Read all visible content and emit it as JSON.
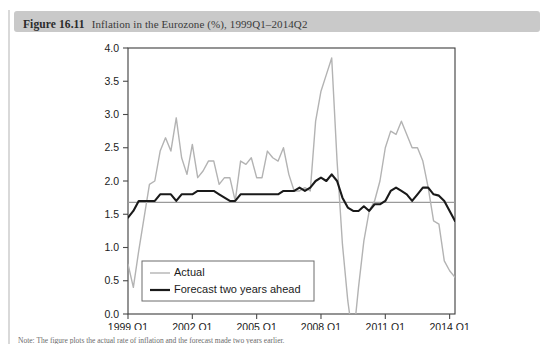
{
  "figure": {
    "number_label": "Figure 16.11",
    "caption": "Inflation in the Eurozone (%), 1999Q1–2014Q2",
    "source_note": "Note: The figure plots the actual rate of inflation and the forecast made two years earlier."
  },
  "colors": {
    "caption_bar": "#c9c9c9",
    "actual_line": "#b3b3b3",
    "forecast_line": "#1a1a1a",
    "reference_line": "#9a9a9a",
    "axis": "#4a4a4a",
    "plot_border": "#3c3c3c",
    "background": "#ffffff"
  },
  "chart_data": {
    "type": "line",
    "title": "Inflation in the Eurozone (%), 1999Q1–2014Q2",
    "xlabel": "",
    "ylabel": "",
    "ylim": [
      0.0,
      4.0
    ],
    "yticks": [
      0.0,
      0.5,
      1.0,
      1.5,
      2.0,
      2.5,
      3.0,
      3.5,
      4.0
    ],
    "ytick_labels": [
      "0.0",
      "0.5",
      "1.0",
      "1.5",
      "2.0",
      "2.5",
      "3.0",
      "3.5",
      "4.0"
    ],
    "xtick_labels": [
      "1999 Q1",
      "2002 Q1",
      "2005 Q1",
      "2008 Q1",
      "2011 Q1",
      "2014 Q1"
    ],
    "xtick_index": [
      0,
      12,
      24,
      36,
      48,
      60
    ],
    "grid": false,
    "legend_position": "bottom-left",
    "reference_line_y": 1.68,
    "x": [
      "1999Q1",
      "1999Q2",
      "1999Q3",
      "1999Q4",
      "2000Q1",
      "2000Q2",
      "2000Q3",
      "2000Q4",
      "2001Q1",
      "2001Q2",
      "2001Q3",
      "2001Q4",
      "2002Q1",
      "2002Q2",
      "2002Q3",
      "2002Q4",
      "2003Q1",
      "2003Q2",
      "2003Q3",
      "2003Q4",
      "2004Q1",
      "2004Q2",
      "2004Q3",
      "2004Q4",
      "2005Q1",
      "2005Q2",
      "2005Q3",
      "2005Q4",
      "2006Q1",
      "2006Q2",
      "2006Q3",
      "2006Q4",
      "2007Q1",
      "2007Q2",
      "2007Q3",
      "2007Q4",
      "2008Q1",
      "2008Q2",
      "2008Q3",
      "2008Q4",
      "2009Q1",
      "2009Q2",
      "2009Q3",
      "2009Q4",
      "2010Q1",
      "2010Q2",
      "2010Q3",
      "2010Q4",
      "2011Q1",
      "2011Q2",
      "2011Q3",
      "2011Q4",
      "2012Q1",
      "2012Q2",
      "2012Q3",
      "2012Q4",
      "2013Q1",
      "2013Q2",
      "2013Q3",
      "2013Q4",
      "2014Q1",
      "2014Q2"
    ],
    "series": [
      {
        "name": "Actual",
        "color": "#b3b3b3",
        "values": [
          0.75,
          0.4,
          0.95,
          1.45,
          1.95,
          2.0,
          2.45,
          2.65,
          2.45,
          2.95,
          2.35,
          2.1,
          2.55,
          2.05,
          2.15,
          2.3,
          2.3,
          1.95,
          2.05,
          2.05,
          1.7,
          2.3,
          2.25,
          2.35,
          2.05,
          2.05,
          2.45,
          2.35,
          2.3,
          2.5,
          2.1,
          1.85,
          1.85,
          1.9,
          1.85,
          2.9,
          3.35,
          3.6,
          3.85,
          2.3,
          1.05,
          0.2,
          -0.4,
          0.4,
          1.1,
          1.55,
          1.7,
          2.0,
          2.5,
          2.75,
          2.7,
          2.9,
          2.7,
          2.5,
          2.5,
          2.3,
          1.9,
          1.4,
          1.35,
          0.8,
          0.65,
          0.55
        ]
      },
      {
        "name": "Forecast two years ahead",
        "color": "#1a1a1a",
        "values": [
          1.45,
          1.55,
          1.7,
          1.7,
          1.7,
          1.7,
          1.8,
          1.8,
          1.8,
          1.7,
          1.8,
          1.8,
          1.8,
          1.85,
          1.85,
          1.85,
          1.85,
          1.8,
          1.75,
          1.7,
          1.7,
          1.8,
          1.8,
          1.8,
          1.8,
          1.8,
          1.8,
          1.8,
          1.8,
          1.85,
          1.85,
          1.85,
          1.9,
          1.85,
          1.9,
          2.0,
          2.05,
          2.0,
          2.1,
          2.0,
          1.75,
          1.6,
          1.55,
          1.55,
          1.62,
          1.55,
          1.65,
          1.65,
          1.7,
          1.85,
          1.9,
          1.85,
          1.8,
          1.7,
          1.8,
          1.9,
          1.9,
          1.8,
          1.78,
          1.7,
          1.55,
          1.4
        ]
      }
    ]
  },
  "legend": {
    "items": [
      {
        "label": "Actual",
        "color": "#b3b3b3",
        "width": 1.4
      },
      {
        "label": "Forecast two years ahead",
        "color": "#1a1a1a",
        "width": 2.2
      }
    ]
  }
}
